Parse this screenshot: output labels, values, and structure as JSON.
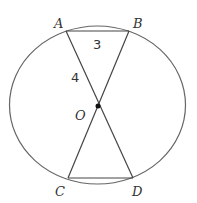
{
  "diagram": {
    "points": {
      "A": {
        "label": "A",
        "x": 66,
        "y": 31
      },
      "B": {
        "label": "B",
        "x": 129,
        "y": 31
      },
      "C": {
        "label": "C",
        "x": 68,
        "y": 178
      },
      "D": {
        "label": "D",
        "x": 133,
        "y": 178
      },
      "O": {
        "label": "O",
        "x": 98,
        "y": 106
      }
    },
    "measures": {
      "AB": "3",
      "AO": "4"
    },
    "circle": {
      "cx": 97.5,
      "cy": 105,
      "rx": 88,
      "ry": 79
    },
    "stroke_color": "#555555"
  }
}
